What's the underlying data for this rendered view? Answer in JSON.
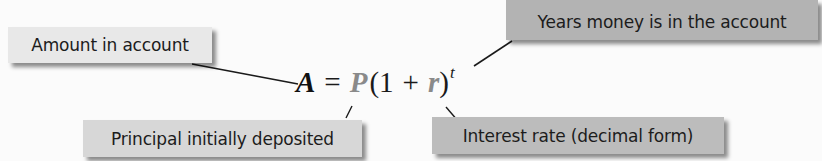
{
  "diagram": {
    "formula": {
      "lhs": "A",
      "equals": "=",
      "principal": "P",
      "open_paren": "(",
      "one": "1",
      "plus": "+",
      "rate": "r",
      "close_paren": ")",
      "exponent": "t"
    },
    "labels": {
      "amount": "Amount in account",
      "years": "Years money is in the account",
      "principal": "Principal initially deposited",
      "interest": "Interest rate (decimal form)"
    },
    "colors": {
      "amount_box": "#e8e8e8",
      "years_box": "#b3b3b3",
      "principal_box": "#d7d7d7",
      "interest_box": "#bcbcbc",
      "highlight_variable": "#8a8a8a",
      "leader_line": "#1a1a1a"
    }
  }
}
